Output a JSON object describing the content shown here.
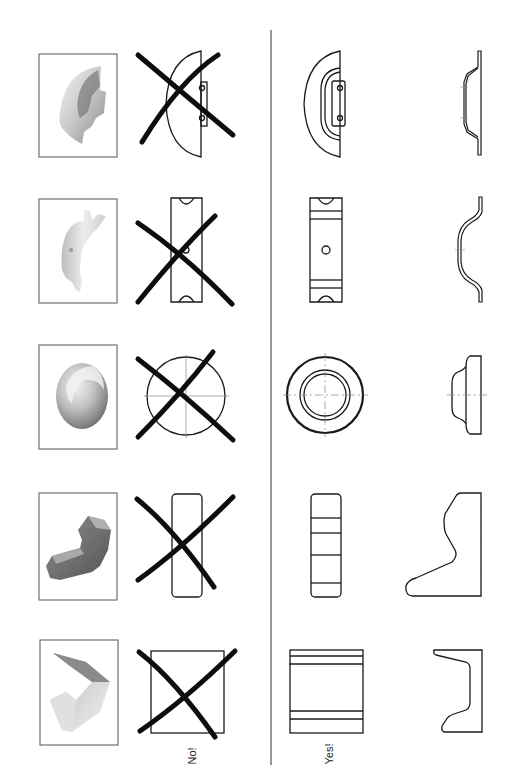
{
  "labels": {
    "bad": "No!",
    "good": "Yes!"
  },
  "colors": {
    "line": "#1a1a1a",
    "cross": "#0d0d0d",
    "divider": "#555555",
    "photo_border": "#555555",
    "centerline": "#888888"
  },
  "rows": [
    {
      "part": "half-round bracket with tab",
      "photo": "shaded-3d-view",
      "bad_view": "single view (crossed out)",
      "good_views": [
        "front view",
        "side section view"
      ]
    },
    {
      "part": "bent strap with slotted ends",
      "photo": "shaded-3d-view",
      "bad_view": "single view (crossed out)",
      "good_views": [
        "front view",
        "side profile view"
      ]
    },
    {
      "part": "round stepped cap",
      "photo": "shaded-3d-view",
      "bad_view": "single circle view (crossed out)",
      "good_views": [
        "front view",
        "side profile view"
      ]
    },
    {
      "part": "angled block",
      "photo": "shaded-3d-view",
      "bad_view": "single rectangle view (crossed out)",
      "good_views": [
        "front view",
        "side profile view"
      ]
    },
    {
      "part": "channel section",
      "photo": "shaded-3d-view",
      "bad_view": "single square view (crossed out)",
      "good_views": [
        "front view",
        "side profile view"
      ]
    }
  ]
}
